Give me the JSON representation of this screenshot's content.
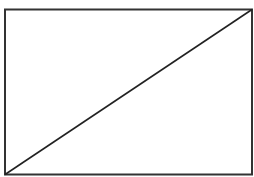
{
  "diagram": {
    "shapes": [
      {
        "type": "rect",
        "x": 5,
        "y": 9.5,
        "width": 247,
        "height": 165,
        "stroke": "#333333",
        "fill": "#ffffff"
      },
      {
        "type": "line",
        "x1": 5,
        "y1": 174.5,
        "x2": 252,
        "y2": 9.5,
        "stroke": "#222222"
      }
    ]
  }
}
